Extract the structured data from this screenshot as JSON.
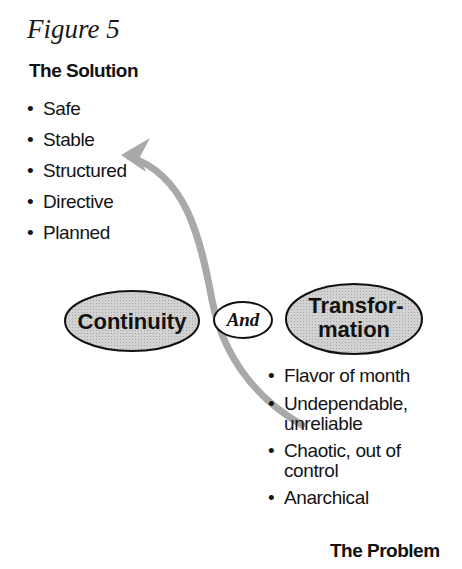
{
  "figure": {
    "title": "Figure 5",
    "solution": {
      "heading": "The Solution",
      "items": [
        "Safe",
        "Stable",
        "Structured",
        "Directive",
        "Planned"
      ]
    },
    "center": {
      "left_label": "Continuity",
      "connector_label": "And",
      "right_label_line1": "Transfor-",
      "right_label_line2": "mation"
    },
    "problem": {
      "heading": "The Problem",
      "items": [
        {
          "line1": "Flavor of month",
          "line2": ""
        },
        {
          "line1": "Undependable,",
          "line2": "unreliable"
        },
        {
          "line1": "Chaotic, out of",
          "line2": "control"
        },
        {
          "line1": "Anarchical",
          "line2": ""
        }
      ]
    },
    "colors": {
      "ellipse_fill": "#c8c8c8",
      "arrow": "#a9a9a9",
      "outline": "#111111"
    }
  }
}
